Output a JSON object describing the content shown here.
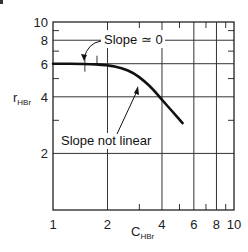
{
  "chart_data": {
    "type": "line",
    "title": "",
    "xlabel": "C",
    "xlabel_sub": "HBr",
    "ylabel": "r",
    "ylabel_sub": "HBr",
    "xscale": "log",
    "yscale": "log",
    "xlim": [
      1,
      10
    ],
    "ylim": [
      1,
      10
    ],
    "grid": true,
    "x_ticks": [
      1,
      2,
      4,
      6,
      8,
      10
    ],
    "x_tick_labels": [
      "1",
      "2",
      "4",
      "6",
      "8",
      "10"
    ],
    "y_ticks": [
      2,
      4,
      6,
      8,
      10
    ],
    "y_tick_labels": [
      "2",
      "4",
      "6",
      "8",
      "10"
    ],
    "x_minor_ticks": [
      3,
      5,
      7,
      9
    ],
    "y_minor_ticks": [
      3,
      5,
      7,
      9
    ],
    "x_grid": [
      2,
      4,
      6,
      8
    ],
    "y_grid": [
      2,
      4,
      6,
      8
    ],
    "series": [
      {
        "name": "r_HBr vs C_HBr",
        "x": [
          1.0,
          1.5,
          2.0,
          2.4,
          2.8,
          3.2,
          3.6,
          4.0,
          4.5,
          5.2
        ],
        "y": [
          6.0,
          6.0,
          5.9,
          5.7,
          5.35,
          4.85,
          4.35,
          3.85,
          3.4,
          2.9
        ]
      }
    ],
    "annotations": [
      {
        "text": "Slope ≃ 0",
        "label_x": 2.1,
        "label_y": 7.6,
        "arrow_to_x": 1.5,
        "arrow_to_y": 6.0
      },
      {
        "text": "Slope not linear",
        "label_x": 1.35,
        "label_y": 2.35,
        "arrow_to_x": 3.3,
        "arrow_to_y": 4.7
      }
    ]
  },
  "labels": {
    "x_axis": "C",
    "x_axis_sub": "HBr",
    "y_axis": "r",
    "y_axis_sub": "HBr",
    "annotation_flat": "Slope ≃ 0",
    "annotation_curve": "Slope not linear"
  }
}
